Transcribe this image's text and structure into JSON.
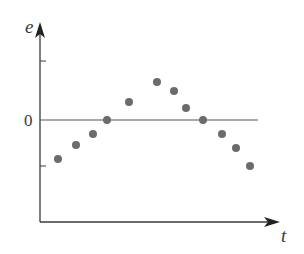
{
  "chart_data": {
    "type": "scatter",
    "title": "",
    "xlabel": "t",
    "ylabel": "e",
    "y_tick_labels": [
      "0"
    ],
    "zero_line": true,
    "grid": false,
    "legend": null,
    "points": [
      {
        "x": 1,
        "y": -1.3
      },
      {
        "x": 2,
        "y": -0.87
      },
      {
        "x": 3,
        "y": -0.47
      },
      {
        "x": 4,
        "y": 0.0
      },
      {
        "x": 5,
        "y": 0.6
      },
      {
        "x": 6,
        "y": 1.27
      },
      {
        "x": 7,
        "y": 0.97
      },
      {
        "x": 8,
        "y": 0.4
      },
      {
        "x": 9,
        "y": 0.0
      },
      {
        "x": 10,
        "y": -0.47
      },
      {
        "x": 11,
        "y": -0.93
      },
      {
        "x": 12,
        "y": -1.53
      }
    ],
    "pixel_points": [
      [
        58,
        159
      ],
      [
        76,
        145
      ],
      [
        93,
        134
      ],
      [
        107,
        120
      ],
      [
        129,
        102
      ],
      [
        157,
        82
      ],
      [
        174,
        91
      ],
      [
        186,
        108
      ],
      [
        203,
        120
      ],
      [
        222,
        134
      ],
      [
        236,
        148
      ],
      [
        250,
        166
      ]
    ],
    "y_ticks_px": {
      "upper": 61,
      "zero": 120,
      "lower": 166
    },
    "colors": {
      "axis": "#3a3a3a",
      "point": "#6b6b6b",
      "zero_line": "#555555"
    }
  }
}
